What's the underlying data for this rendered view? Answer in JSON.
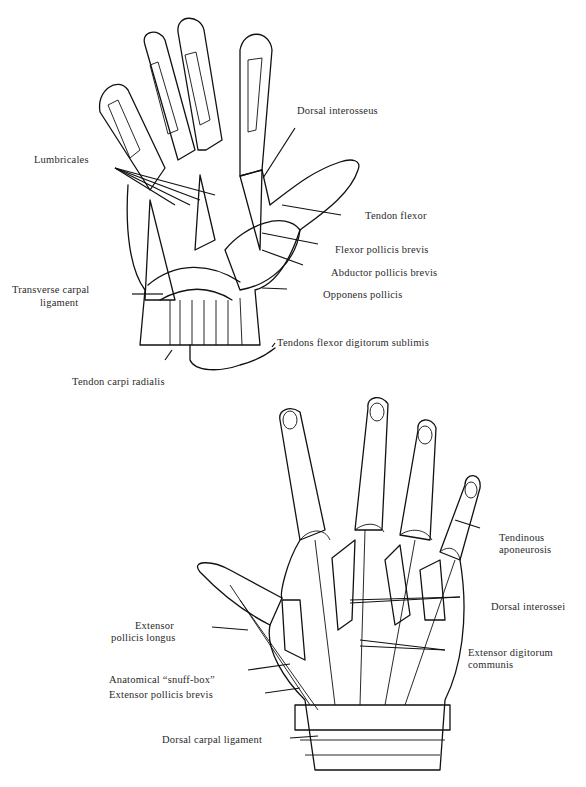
{
  "figure": {
    "top_panel": {
      "name": "Palmar view of hand",
      "labels": {
        "dorsal_interosseus": "Dorsal   interosseus",
        "lumbricales": "Lumbricales",
        "tendon_flexor": "Tendon flexor",
        "flexor_pollicis_brevis": "Flexor pollicis brevis",
        "abductor_pollicis_brevis": "Abductor pollicis brevis",
        "opponens_pollicis": "Opponens pollicis",
        "transverse_carpal_ligament_1": "Transverse carpal",
        "transverse_carpal_ligament_2": "ligament",
        "tendons_flexor_digitorum_sublimis": "Tendons flexor digitorum sublimis",
        "tendon_carpi_radialis": "Tendon carpi radialis"
      }
    },
    "bottom_panel": {
      "name": "Dorsal view of hand",
      "labels": {
        "tendinous_aponeurosis_1": "Tendinous",
        "tendinous_aponeurosis_2": "aponeurosis",
        "dorsal_interossei": "Dorsal interossei",
        "extensor_digitorum_communis_1": "Extensor digitorum",
        "extensor_digitorum_communis_2": "communis",
        "extensor_pollicis_longus_1": "Extensor",
        "extensor_pollicis_longus_2": "pollicis longus",
        "anatomical_snuff_box": "Anatomical “snuff-box”",
        "extensor_pollicis_brevis": "Extensor pollicis brevis",
        "dorsal_carpal_ligament": "Dorsal carpal ligament"
      }
    },
    "colors": {
      "ink": "#111111",
      "background": "#ffffff"
    }
  }
}
